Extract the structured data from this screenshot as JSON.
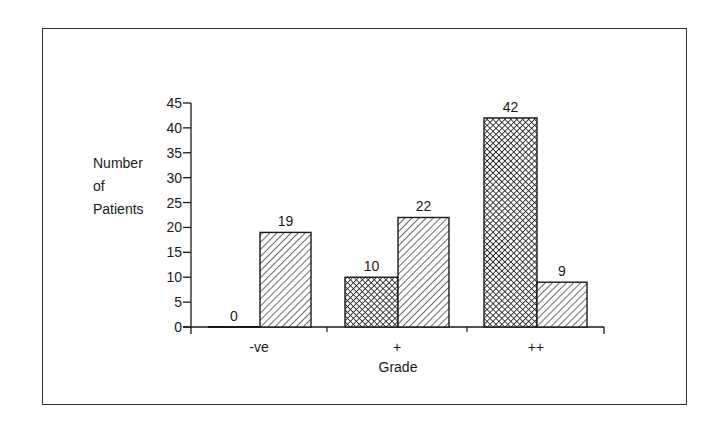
{
  "chart_data": {
    "type": "bar",
    "title": "",
    "xlabel": "Grade",
    "ylabel": "Number of Patients",
    "ylabel_lines": [
      "Number",
      "of",
      "Patients"
    ],
    "categories": [
      "-ve",
      "+",
      "++"
    ],
    "series": [
      {
        "name": "Series A (cross-hatched)",
        "pattern": "cross-hatch",
        "values": [
          0,
          10,
          42
        ]
      },
      {
        "name": "Series B (diagonal hatched)",
        "pattern": "diagonal-hatch",
        "values": [
          19,
          22,
          9
        ]
      }
    ],
    "data_labels": [
      [
        "0",
        "19"
      ],
      [
        "10",
        "22"
      ],
      [
        "42",
        "9"
      ]
    ],
    "yticks": [
      0,
      5,
      10,
      15,
      20,
      25,
      30,
      35,
      40,
      45
    ],
    "ylim": [
      0,
      45
    ],
    "grid": false,
    "legend": "none",
    "colors": {
      "ink": "#1a1a1a",
      "background": "#ffffff",
      "frame": "#333333"
    }
  }
}
